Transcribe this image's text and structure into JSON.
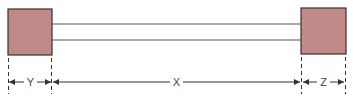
{
  "diagram": {
    "colors": {
      "block_fill": "#bf8a88",
      "block_stroke": "#3a3030",
      "line": "#555555"
    },
    "left_block": {
      "name": "left-block"
    },
    "right_block": {
      "name": "right-block"
    },
    "dimensions": [
      {
        "label": "Y",
        "span": "left block width"
      },
      {
        "label": "X",
        "span": "gap between blocks"
      },
      {
        "label": "Z",
        "span": "right block width"
      }
    ]
  }
}
